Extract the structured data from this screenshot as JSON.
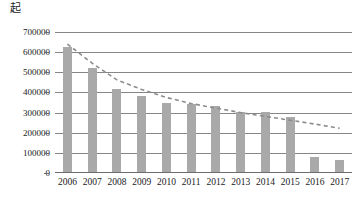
{
  "chart_data": {
    "type": "bar",
    "title": "",
    "ylabel": "起",
    "xlabel": "",
    "categories": [
      "2006",
      "2007",
      "2008",
      "2009",
      "2010",
      "2011",
      "2012",
      "2013",
      "2014",
      "2015",
      "2016",
      "2017"
    ],
    "values": [
      620000,
      515000,
      410000,
      375000,
      345000,
      340000,
      330000,
      300000,
      300000,
      275000,
      75000,
      60000
    ],
    "series": [
      {
        "name": "起数",
        "type": "bar",
        "values": [
          620000,
          515000,
          410000,
          375000,
          345000,
          340000,
          330000,
          300000,
          300000,
          275000,
          75000,
          60000
        ]
      },
      {
        "name": "趋势线",
        "type": "line",
        "style": "dashed",
        "values": [
          640000,
          545000,
          462000,
          415000,
          375000,
          345000,
          322000,
          300000,
          281000,
          262000,
          243000,
          222000
        ]
      }
    ],
    "ylim": [
      0,
      700000
    ],
    "yticks": [
      0,
      100000,
      200000,
      300000,
      400000,
      500000,
      600000,
      700000
    ],
    "ytick_labels": [
      "0",
      "100000",
      "200000",
      "300000",
      "400000",
      "500000",
      "600000",
      "700000"
    ],
    "grid": true,
    "legend": "none",
    "bar_color": "#a9a9a9",
    "grid_color": "#868686",
    "trend_color": "#8c8c8c",
    "background": "#ffffff"
  }
}
